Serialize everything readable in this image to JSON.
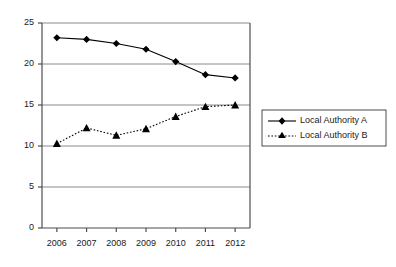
{
  "chart_data": {
    "type": "line",
    "title": "",
    "xlabel": "",
    "ylabel": "",
    "categories": [
      "2006",
      "2007",
      "2008",
      "2009",
      "2010",
      "2011",
      "2012"
    ],
    "x": [
      2006,
      2007,
      2008,
      2009,
      2010,
      2011,
      2012
    ],
    "series": [
      {
        "name": "Local Authority A",
        "values": [
          23.2,
          23.0,
          22.5,
          21.8,
          20.3,
          18.7,
          18.3
        ],
        "marker": "diamond",
        "linestyle": "solid",
        "color": "#000000"
      },
      {
        "name": "Local Authority B",
        "values": [
          10.3,
          12.2,
          11.3,
          12.1,
          13.6,
          14.8,
          15.0
        ],
        "marker": "triangle",
        "linestyle": "dotted",
        "color": "#000000"
      }
    ],
    "ylim": [
      0,
      25
    ],
    "yticks": [
      0,
      5,
      10,
      15,
      20,
      25
    ],
    "ytick_labels": [
      "0",
      "5",
      "10",
      "15",
      "20",
      "25"
    ],
    "xtick_labels": [
      "2006",
      "2007",
      "2008",
      "2009",
      "2010",
      "2011",
      "2012"
    ],
    "grid": true,
    "grid_axis": "y",
    "legend_position": "right",
    "legend_entries": [
      "Local Authority A",
      "Local Authority B"
    ],
    "background_color": "#ffffff",
    "axis_color": "#4d4d4d",
    "grid_color": "#808080"
  }
}
